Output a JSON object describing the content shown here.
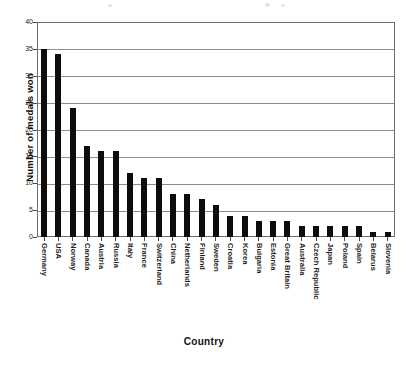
{
  "chart_data": {
    "type": "bar",
    "title": "",
    "xlabel": "Country",
    "ylabel": "Number of medals won",
    "ylim": [
      0,
      40
    ],
    "ytick_step": 5,
    "yticks": [
      0,
      5,
      10,
      15,
      20,
      25,
      30,
      35,
      40
    ],
    "grid": true,
    "legend": false,
    "orientation": "vertical",
    "bar_color": "#0d0d0d",
    "categories": [
      "Germany",
      "USA",
      "Norway",
      "Canada",
      "Austria",
      "Russia",
      "Italy",
      "France",
      "Switzerland",
      "China",
      "Netherlands",
      "Finland",
      "Sweden",
      "Croatia",
      "Korea",
      "Bulgaria",
      "Estonia",
      "Great Britain",
      "Australia",
      "Czech Republic",
      "Japan",
      "Poland",
      "Spain",
      "Belarus",
      "Slovenia"
    ],
    "values": [
      35,
      34,
      24,
      17,
      16,
      16,
      12,
      11,
      11,
      8,
      8,
      7,
      6,
      4,
      4,
      3,
      3,
      3,
      2,
      2,
      2,
      2,
      2,
      1,
      1
    ]
  }
}
